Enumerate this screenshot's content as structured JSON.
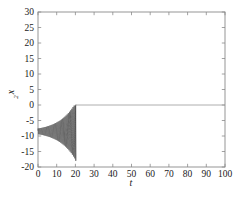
{
  "chart_data": {
    "type": "line",
    "title": "",
    "xlabel": "t",
    "ylabel": "x",
    "ylabel_sub": "2",
    "xlim": [
      0,
      100
    ],
    "ylim": [
      -20,
      30
    ],
    "xticks": [
      0,
      10,
      20,
      30,
      40,
      50,
      60,
      70,
      80,
      90,
      100
    ],
    "yticks": [
      -20,
      -15,
      -10,
      -5,
      0,
      5,
      10,
      15,
      20,
      25,
      30
    ],
    "xtick_labels": [
      "0",
      "10",
      "20",
      "30",
      "40",
      "50",
      "60",
      "70",
      "80",
      "90",
      "100"
    ],
    "ytick_labels": [
      "-20",
      "-15",
      "-10",
      "-5",
      "0",
      "5",
      "10",
      "15",
      "20",
      "25",
      "30"
    ],
    "grid": false,
    "legend": false,
    "series": [
      {
        "name": "x2",
        "color": "#2b2b2b",
        "description": "Growing oscillation about a mean near -8.5 from t=0 to t=20, envelope expanding from about +/-1 to +/-9, ending with a sharp excursion to -18 then settling to 0 for t > 20",
        "segments": [
          {
            "name": "oscillatory-transient",
            "t_start": 0,
            "t_end": 20.2,
            "mean": -8.5,
            "envelope_start": 0.9,
            "envelope_end": 9.3,
            "growth": "exponential",
            "period": 0.62,
            "min_value": -18.0,
            "max_value": -0.2
          },
          {
            "name": "settled-zero",
            "t_start": 20.2,
            "t_end": 100,
            "value": 0.0,
            "color": "#9a9a9a"
          }
        ]
      }
    ]
  },
  "figure": {
    "background": "#ffffff",
    "frame_color": "#8a8a8a",
    "text_color": "#1a1a1a"
  }
}
